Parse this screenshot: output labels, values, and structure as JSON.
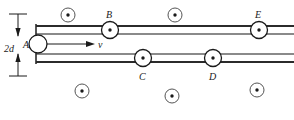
{
  "figure": {
    "width": 294,
    "height": 120,
    "background_color": "#ffffff",
    "ink_color": "#1a1a1a",
    "rail_color_thick": "#2b2b2b",
    "rail_color_thin": "#8a8a8a"
  },
  "dimension": {
    "label": "2d",
    "x": 4,
    "y": 44,
    "arrow_x": 18,
    "top_tick_y": 14,
    "bottom_tick_y": 76,
    "tick_half_width": 9
  },
  "velocity": {
    "label": "v",
    "label_x": 98,
    "label_y": 40,
    "arrow_from_x": 44,
    "arrow_to_x": 94,
    "arrow_y": 44
  },
  "rails": [
    {
      "name": "upper-outer-rail",
      "y": 26,
      "stroke": "#2b2b2b",
      "width": 2.6,
      "x1": 36,
      "x2": 294
    },
    {
      "name": "upper-inner-rail",
      "y": 34,
      "stroke": "#8a8a8a",
      "width": 1.2,
      "x1": 36,
      "x2": 294
    },
    {
      "name": "lower-inner-rail",
      "y": 54,
      "stroke": "#8a8a8a",
      "width": 1.2,
      "x1": 36,
      "x2": 294
    },
    {
      "name": "lower-outer-rail",
      "y": 62,
      "stroke": "#2b2b2b",
      "width": 2.6,
      "x1": 36,
      "x2": 294
    }
  ],
  "left_end_bar": {
    "name": "left-end-bar",
    "x": 36,
    "y1": 24,
    "y2": 64,
    "stroke": "#2b2b2b",
    "width": 1.6
  },
  "rod": {
    "name": "moving-rod",
    "label": "A",
    "label_x": 23,
    "label_y": 40,
    "cx": 38,
    "cy": 44,
    "r": 9
  },
  "points_on_rails": [
    {
      "label": "B",
      "cx": 110,
      "cy": 30,
      "r": 8.5,
      "dot_r": 1.7,
      "label_x": 106,
      "label_y": 10,
      "rail": "upper"
    },
    {
      "label": "E",
      "cx": 259,
      "cy": 30,
      "r": 8.5,
      "dot_r": 1.7,
      "label_x": 255,
      "label_y": 10,
      "rail": "upper"
    },
    {
      "label": "C",
      "cx": 143,
      "cy": 58,
      "r": 8.5,
      "dot_r": 1.7,
      "label_x": 139,
      "label_y": 72,
      "rail": "lower"
    },
    {
      "label": "D",
      "cx": 213,
      "cy": 58,
      "r": 8.5,
      "dot_r": 1.7,
      "label_x": 209,
      "label_y": 72,
      "rail": "lower"
    }
  ],
  "field_dots": [
    {
      "name": "field-dot-top-left",
      "cx": 68,
      "cy": 15,
      "r": 7,
      "dot_r": 1.7
    },
    {
      "name": "field-dot-top-middle",
      "cx": 175,
      "cy": 15,
      "r": 7,
      "dot_r": 1.7
    },
    {
      "name": "field-dot-bottom-left",
      "cx": 82,
      "cy": 91,
      "r": 7,
      "dot_r": 1.7
    },
    {
      "name": "field-dot-bottom-mid",
      "cx": 172,
      "cy": 96,
      "r": 7,
      "dot_r": 1.7
    },
    {
      "name": "field-dot-bottom-right",
      "cx": 257,
      "cy": 90,
      "r": 7,
      "dot_r": 1.7
    }
  ]
}
